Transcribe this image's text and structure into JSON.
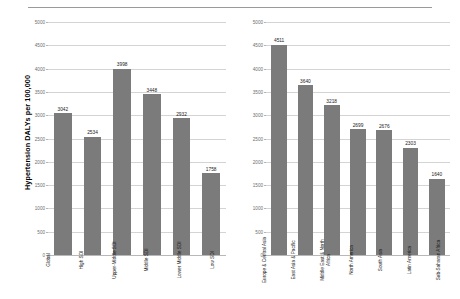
{
  "axis": {
    "y_title": "Hypertension DALYs per 100,000",
    "ticks": [
      "0",
      "500",
      "1000",
      "1500",
      "2000",
      "2500",
      "3000",
      "3500",
      "4000",
      "4500",
      "5000"
    ]
  },
  "chart_data": [
    {
      "type": "bar",
      "title": "",
      "xlabel": "",
      "ylabel": "Hypertension DALYs per 100,000",
      "ylim": [
        0,
        5000
      ],
      "ytick_step": 500,
      "grid": true,
      "legend": "none",
      "bar_color": "#7b7b7b",
      "categories": [
        "Global",
        "High SDI",
        "Upper-Middle SDI",
        "Middle SDI",
        "Lower Middle SDI",
        "Low SDI"
      ],
      "values": [
        3042,
        2534,
        3998,
        3448,
        2932,
        1758
      ],
      "data_labels": [
        "3042",
        "2534",
        "3998",
        "3448",
        "2932",
        "1758"
      ]
    },
    {
      "type": "bar",
      "title": "",
      "xlabel": "",
      "ylabel": "",
      "ylim": [
        0,
        5000
      ],
      "ytick_step": 500,
      "grid": true,
      "legend": "none",
      "bar_color": "#7b7b7b",
      "categories": [
        "Europe & Central Asia",
        "East Asia & Pacific",
        "Middle East & North Africa",
        "North America",
        "South Asia",
        "Latin America",
        "Sub-Saharan Africa"
      ],
      "values": [
        4511,
        3640,
        3218,
        2699,
        2676,
        2303,
        1640
      ],
      "data_labels": [
        "4511",
        "3640",
        "3218",
        "2699",
        "2676",
        "2303",
        "1640"
      ]
    }
  ]
}
